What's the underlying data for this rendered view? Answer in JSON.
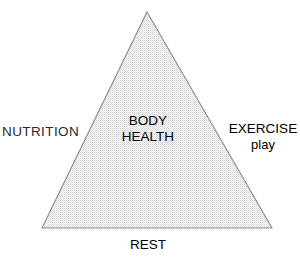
{
  "diagram": {
    "type": "triangle-venn-concept",
    "title_internal": "BODY HEALTH",
    "background_color": "#ffffff",
    "outline_color": "#8a8a8a",
    "fill_pattern": "light-gray-stipple",
    "fill_color": "#d9d9d9",
    "text_color": "#2b2b2b",
    "geometry": {
      "apex_x": 147,
      "apex_y": 12,
      "bottom_left_x": 42,
      "bottom_left_y": 228,
      "bottom_right_x": 272,
      "bottom_right_y": 228
    },
    "center": {
      "line1": "BODY",
      "line2": "HEALTH"
    },
    "vertices": [
      {
        "id": "nutrition",
        "label": "NUTRITION",
        "sub": "",
        "position": "left"
      },
      {
        "id": "exercise",
        "label": "EXERCISE",
        "sub": "play",
        "position": "right"
      },
      {
        "id": "rest",
        "label": "REST",
        "sub": "",
        "position": "bottom"
      }
    ]
  }
}
